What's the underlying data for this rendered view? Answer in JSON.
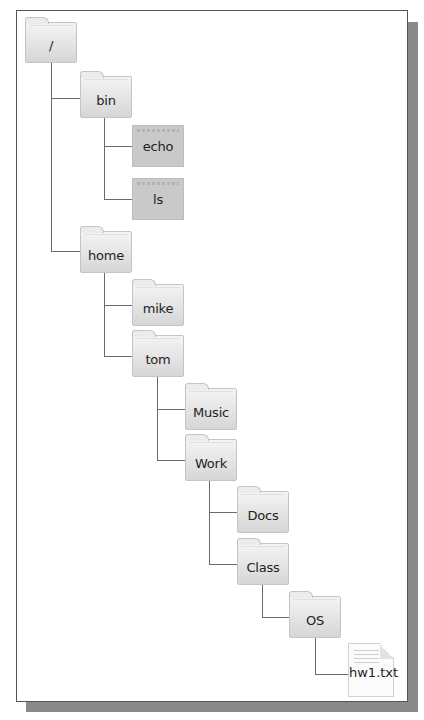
{
  "diagram": {
    "type": "directory-tree",
    "nodes": [
      {
        "id": "root",
        "label": "/",
        "kind": "folder",
        "parent": null
      },
      {
        "id": "bin",
        "label": "bin",
        "kind": "folder",
        "parent": "root"
      },
      {
        "id": "echo",
        "label": "echo",
        "kind": "executable",
        "parent": "bin"
      },
      {
        "id": "ls",
        "label": "ls",
        "kind": "executable",
        "parent": "bin"
      },
      {
        "id": "home",
        "label": "home",
        "kind": "folder",
        "parent": "root"
      },
      {
        "id": "mike",
        "label": "mike",
        "kind": "folder",
        "parent": "home"
      },
      {
        "id": "tom",
        "label": "tom",
        "kind": "folder",
        "parent": "home"
      },
      {
        "id": "music",
        "label": "Music",
        "kind": "folder",
        "parent": "tom"
      },
      {
        "id": "work",
        "label": "Work",
        "kind": "folder",
        "parent": "tom"
      },
      {
        "id": "docs",
        "label": "Docs",
        "kind": "folder",
        "parent": "work"
      },
      {
        "id": "class",
        "label": "Class",
        "kind": "folder",
        "parent": "work"
      },
      {
        "id": "os",
        "label": "OS",
        "kind": "folder",
        "parent": "class"
      },
      {
        "id": "hw1",
        "label": "hw1.txt",
        "kind": "text-file",
        "parent": "os"
      }
    ],
    "colors": {
      "folder_top": "#f4f4f4",
      "folder_bottom": "#d6d6d6",
      "executable": "#c9c9c9",
      "connector": "#6a6a6a",
      "frame_shadow": "#8a8a8a"
    }
  }
}
